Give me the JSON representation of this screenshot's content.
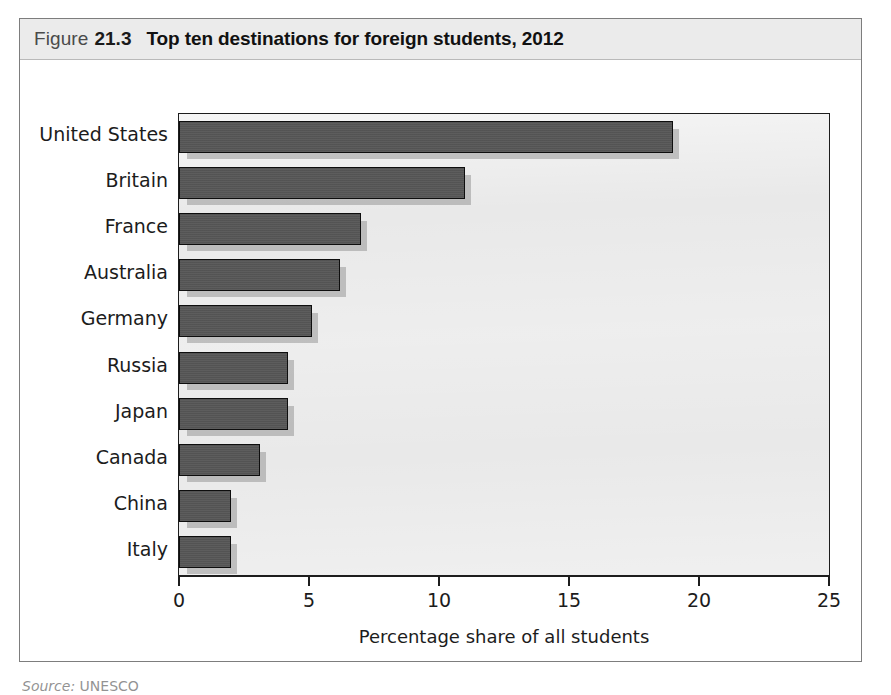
{
  "figure": {
    "label": "Figure",
    "number": "21.3",
    "title": "Top ten destinations for foreign students, 2012"
  },
  "source_note": {
    "prefix": "Source:",
    "text": "UNESCO"
  },
  "colors": {
    "bar_fill": "#565656",
    "bar_outline": "#0e0e0e",
    "plot_background": "#e9e9e9",
    "title_band": "#ebebeb",
    "frame_border": "#7d7d7d",
    "axis": "#1d1d1d",
    "text": "#1c1c1c"
  },
  "chart_data": {
    "type": "bar",
    "orientation": "horizontal",
    "title": "Top ten destinations for foreign students, 2012",
    "xlabel": "Percentage share of all students",
    "ylabel": "",
    "xlim": [
      0,
      25
    ],
    "xticks": [
      0,
      5,
      10,
      15,
      20,
      25
    ],
    "xtick_labels": [
      "0",
      "5",
      "10",
      "15",
      "20",
      "25"
    ],
    "grid": false,
    "legend": false,
    "categories": [
      "United States",
      "Britain",
      "France",
      "Australia",
      "Germany",
      "Russia",
      "Japan",
      "Canada",
      "China",
      "Italy"
    ],
    "values": [
      19.0,
      11.0,
      7.0,
      6.2,
      5.1,
      4.2,
      4.2,
      3.1,
      2.0,
      2.0
    ],
    "units": "percent",
    "series": [
      {
        "name": "Percentage share of all students",
        "values": [
          19.0,
          11.0,
          7.0,
          6.2,
          5.1,
          4.2,
          4.2,
          3.1,
          2.0,
          2.0
        ]
      }
    ]
  }
}
